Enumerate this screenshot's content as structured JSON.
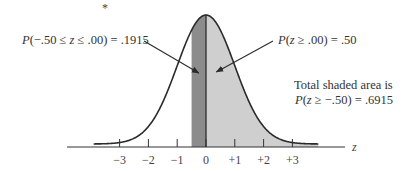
{
  "chart_data": {
    "type": "area",
    "title": "",
    "distribution": "standard normal",
    "xlabel": "z",
    "ylabel": "",
    "xlim": [
      -3.9,
      3.9
    ],
    "x_ticks": [
      -3,
      -2,
      -1,
      0,
      1,
      2,
      3
    ],
    "x_tick_labels": [
      "−3",
      "−2",
      "−1",
      "0",
      "+1",
      "+2",
      "+3"
    ],
    "shaded_regions": [
      {
        "name": "dark",
        "from": -0.5,
        "to": 0.0,
        "color": "#8c8c8c",
        "probability": 0.1915
      },
      {
        "name": "light",
        "from": 0.0,
        "to": 3.9,
        "color": "#cfcfcf",
        "probability": 0.5
      }
    ],
    "annotations": [
      {
        "id": "left",
        "parts": [
          "P",
          "(−.50 ≤ ",
          "z",
          " ≤ .00) = .1915"
        ],
        "points_to": -0.25
      },
      {
        "id": "right",
        "parts": [
          "P",
          "(",
          "z",
          " ≥ .00) = .50"
        ],
        "points_to": 0.5
      },
      {
        "id": "total_line1",
        "text": "Total shaded area is"
      },
      {
        "id": "total_line2",
        "parts": [
          "P",
          "(",
          "z",
          " ≥ −.50) = .6915"
        ]
      }
    ],
    "grid": false,
    "legend": "none"
  },
  "colors": {
    "curve": "#2b2b2b",
    "axis": "#333333",
    "dark_fill": "#8c8c8c",
    "light_fill": "#cfcfcf"
  },
  "stray_mark": "*"
}
